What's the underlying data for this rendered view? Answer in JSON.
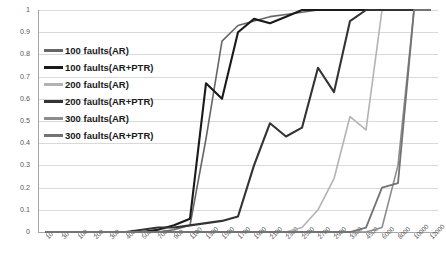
{
  "chart_data": {
    "type": "line",
    "title": "",
    "xlabel": "",
    "ylabel": "",
    "ylim": [
      0,
      1
    ],
    "yticks": [
      "0",
      "0.1",
      "0.2",
      "0.3",
      "0.4",
      "0.5",
      "0.6",
      "0.7",
      "0.8",
      "0.9",
      "1"
    ],
    "grid": true,
    "legend_position": "inside-left",
    "categories": [
      "10",
      "30",
      "100",
      "200",
      "300",
      "400",
      "500",
      "700",
      "900",
      "1100",
      "1300",
      "1500",
      "1700",
      "1900",
      "2100",
      "2300",
      "2500",
      "2700",
      "2900",
      "3300",
      "4500",
      "6000",
      "8000",
      "10000",
      "12000"
    ],
    "series": [
      {
        "name": "100 faults(AR)",
        "color": "#666666",
        "width": 1.6,
        "values": [
          0,
          0,
          0,
          0,
          0,
          0,
          0,
          0,
          0.01,
          0.03,
          0.42,
          0.86,
          0.93,
          0.95,
          0.97,
          0.98,
          0.99,
          1,
          1,
          1,
          1,
          1,
          1,
          1,
          1
        ]
      },
      {
        "name": "100 faults(AR+PTR)",
        "color": "#1a1a1a",
        "width": 2.1,
        "values": [
          0,
          0,
          0,
          0,
          0,
          0,
          0,
          0.01,
          0.03,
          0.06,
          0.67,
          0.6,
          0.9,
          0.96,
          0.94,
          0.97,
          1,
          1,
          1,
          1,
          1,
          1,
          1,
          1,
          1
        ]
      },
      {
        "name": "200 faults(AR)",
        "color": "#b3b3b3",
        "width": 1.6,
        "values": [
          0,
          0,
          0,
          0,
          0,
          0,
          0,
          0,
          0,
          0,
          0,
          0,
          0,
          0,
          0,
          0,
          0.02,
          0.1,
          0.24,
          0.52,
          0.46,
          1,
          1,
          1,
          1
        ]
      },
      {
        "name": "200 faults(AR+PTR)",
        "color": "#333333",
        "width": 2.1,
        "values": [
          0,
          0,
          0,
          0,
          0,
          0,
          0.01,
          0.02,
          0.02,
          0.03,
          0.04,
          0.05,
          0.07,
          0.3,
          0.49,
          0.43,
          0.47,
          0.74,
          0.63,
          0.95,
          1,
          1,
          1,
          1,
          1
        ]
      },
      {
        "name": "300 faults(AR)",
        "color": "#8c8c8c",
        "width": 1.6,
        "values": [
          0,
          0,
          0,
          0,
          0,
          0,
          0,
          0,
          0,
          0,
          0,
          0,
          0,
          0,
          0,
          0,
          0,
          0,
          0,
          0,
          0,
          0.02,
          0.3,
          1,
          1
        ]
      },
      {
        "name": "300 faults(AR+PTR)",
        "color": "#737373",
        "width": 1.8,
        "values": [
          0,
          0,
          0,
          0,
          0,
          0,
          0,
          0,
          0,
          0,
          0,
          0,
          0,
          0,
          0,
          0,
          0,
          0,
          0,
          0,
          0.02,
          0.2,
          0.22,
          1,
          1
        ]
      }
    ]
  },
  "legend": {
    "items": [
      {
        "label": "100 faults(AR)"
      },
      {
        "label": "100 faults(AR+PTR)"
      },
      {
        "label": "200 faults(AR)"
      },
      {
        "label": "200 faults(AR+PTR)"
      },
      {
        "label": "300 faults(AR)"
      },
      {
        "label": "300 faults(AR+PTR)"
      }
    ]
  }
}
